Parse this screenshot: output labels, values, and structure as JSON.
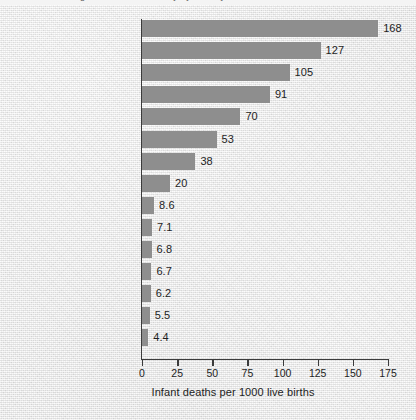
{
  "page": {
    "top_cropped_caption": "Figure — Infant mortality by country",
    "background_color": "#e9e9e9",
    "bar_color": "#8e8e8e",
    "axis_color": "#3b3b3b",
    "text_color": "#1d1d1d"
  },
  "chart_data": {
    "type": "bar",
    "orientation": "horizontal",
    "title": "",
    "subtitle": "",
    "xlabel": "Infant deaths per 1000 live births",
    "ylabel": "",
    "xlim": [
      0,
      175
    ],
    "xticks": [
      0,
      25,
      50,
      75,
      100,
      125,
      150,
      175
    ],
    "xtick_labels": [
      "0",
      "25",
      "50",
      "75",
      "100",
      "125",
      "150",
      "175"
    ],
    "grid": false,
    "legend": false,
    "legend_position": "none",
    "bar_color": "#8e8e8e",
    "data_labels": true,
    "categories": [
      "Afghanistan",
      "Ethiopia",
      "Haiti",
      "India",
      "WORLD",
      "People's Republic of China",
      "Mexico",
      "Former Soviet Union",
      "United States",
      "Great Britain",
      "Canada",
      "Germany",
      "Sweden",
      "Iceland",
      "Japan"
    ],
    "values": [
      168,
      127,
      105,
      91,
      70,
      53,
      38,
      20,
      8.6,
      7.1,
      6.8,
      6.7,
      6.2,
      5.5,
      4.4
    ],
    "value_labels": [
      "168",
      "127",
      "105",
      "91",
      "70",
      "53",
      "38",
      "20",
      "8.6",
      "7.1",
      "6.8",
      "6.7",
      "6.2",
      "5.5",
      "4.4"
    ]
  }
}
